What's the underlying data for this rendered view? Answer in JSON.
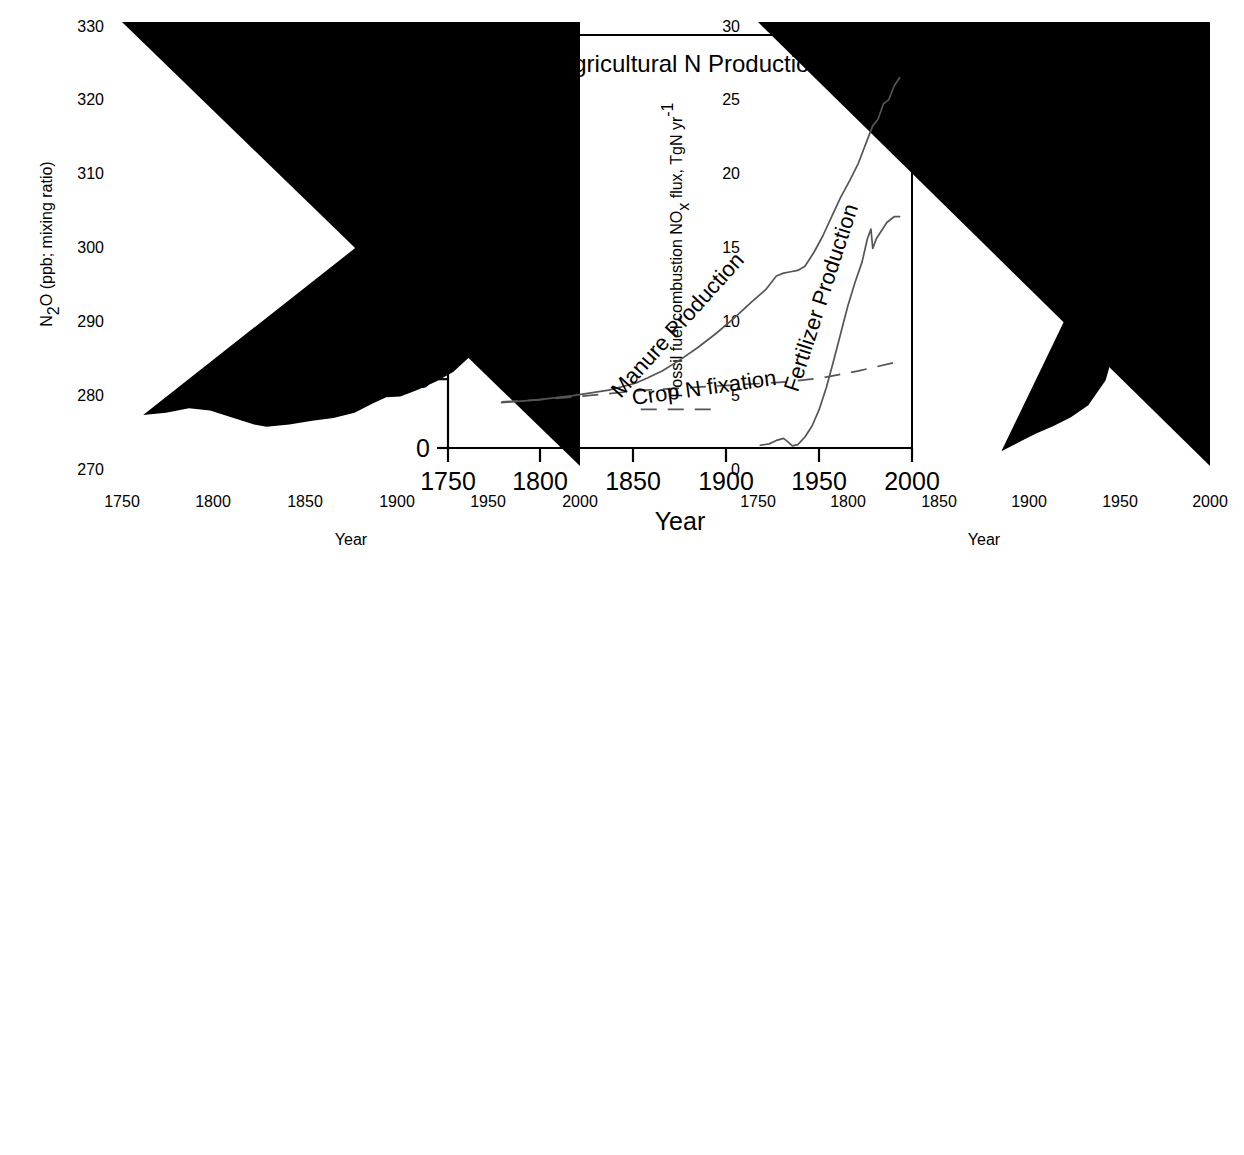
{
  "figure": {
    "panel_count": 3,
    "line_color": "#555555",
    "axis_color": "#000000",
    "background": "#ffffff"
  },
  "chart_data": [
    {
      "id": "n2o",
      "type": "line",
      "title": "N2O (ice core record)",
      "title_parts": {
        "pre": "N",
        "sub": "2",
        "post": "O (ice core record)"
      },
      "xlabel": "Year",
      "ylabel": "N2O (ppb; mixing ratio)",
      "ylabel_parts": {
        "pre": "N",
        "sub": "2",
        "post": "O (ppb; mixing ratio)"
      },
      "xlim": [
        1750,
        2010
      ],
      "ylim": [
        270,
        330
      ],
      "xticks": [
        1750,
        1800,
        1850,
        1900,
        1950,
        2000
      ],
      "yticks": [
        270,
        280,
        290,
        300,
        310,
        320,
        330
      ],
      "grid": false,
      "legend": "none",
      "series": [
        {
          "name": "N2O ice core record",
          "style": "solid",
          "x": [
            1762,
            1775,
            1788,
            1800,
            1812,
            1825,
            1832,
            1845,
            1858,
            1870,
            1882,
            1892,
            1900,
            1908,
            1918,
            1928,
            1938,
            1948,
            1958,
            1968,
            1978,
            1988,
            1998,
            2008
          ],
          "y": [
            276.9,
            277.2,
            277.8,
            277.5,
            276.6,
            275.6,
            275.3,
            275.6,
            276.1,
            276.5,
            277.2,
            278.4,
            279.3,
            279.4,
            280.3,
            281.4,
            282.7,
            284.9,
            287.1,
            290.2,
            294.3,
            300.6,
            310.8,
            323.0
          ]
        }
      ]
    },
    {
      "id": "nox",
      "type": "line",
      "title": "NOx (fossil fuel combustion)",
      "title_parts": {
        "pre": "NO",
        "sub": "x",
        "post": " (fossil fuel combustion)"
      },
      "xlabel": "Year",
      "ylabel": "Fossil fuel combustion NOx  flux, TgN yr-1",
      "ylabel_parts": {
        "pre": "Fossil fuel combustion NO",
        "sub": "x",
        "mid": "  flux, TgN yr",
        "sup": "-1"
      },
      "xlim": [
        1750,
        2010
      ],
      "ylim": [
        0,
        30
      ],
      "xticks": [
        1750,
        1800,
        1850,
        1900,
        1950,
        2000
      ],
      "yticks": [
        0,
        5,
        10,
        15,
        20,
        25,
        30
      ],
      "grid": false,
      "legend": "none",
      "series": [
        {
          "name": "Fossil fuel combustion NOx flux",
          "style": "solid",
          "x": [
            1890,
            1900,
            1910,
            1920,
            1930,
            1940,
            1950,
            1960,
            1970,
            1980,
            1990,
            1998
          ],
          "y": [
            1.0,
            1.6,
            2.2,
            2.7,
            3.3,
            4.1,
            5.8,
            10.0,
            15.0,
            19.6,
            24.9,
            27.3
          ]
        }
      ]
    },
    {
      "id": "agricultural_n",
      "type": "line",
      "title": "Agricultural N Production",
      "xlabel": "Year",
      "ylabel": "TgN yr-1",
      "ylabel_parts": {
        "pre": "TgN yr",
        "sup": "-1"
      },
      "xlim": [
        1750,
        2010
      ],
      "ylim": [
        0,
        30
      ],
      "xticks": [
        1750,
        1800,
        1850,
        1900,
        1950,
        2000
      ],
      "yticks": [
        0,
        5,
        10,
        15,
        20,
        25,
        30
      ],
      "grid": false,
      "legend": "inline-labels",
      "series": [
        {
          "name": "Manure Production",
          "label": "Manure  Production",
          "style": "solid",
          "x": [
            1780,
            1800,
            1820,
            1840,
            1855,
            1862,
            1870,
            1880,
            1890,
            1900,
            1910,
            1920,
            1928,
            1934,
            1938,
            1942,
            1946,
            1950,
            1955,
            1960,
            1965,
            1970,
            1975,
            1980,
            1985,
            1988,
            1991,
            1994,
            1997,
            2000,
            2003
          ],
          "y": [
            3.3,
            3.5,
            3.8,
            4.2,
            4.7,
            5.1,
            5.6,
            6.4,
            7.3,
            8.3,
            9.4,
            10.6,
            11.5,
            12.5,
            12.7,
            12.8,
            12.9,
            13.2,
            14.2,
            15.4,
            16.8,
            18.2,
            19.4,
            20.7,
            22.4,
            23.4,
            23.9,
            25.0,
            25.3,
            26.3,
            26.9
          ]
        },
        {
          "name": "Fertilizer Production",
          "label": "Fertilizer  Production",
          "style": "solid",
          "x": [
            1925,
            1930,
            1934,
            1938,
            1940,
            1943,
            1946,
            1950,
            1954,
            1958,
            1962,
            1966,
            1970,
            1974,
            1978,
            1982,
            1985,
            1987,
            1988,
            1990,
            1993,
            1996,
            2000,
            2003
          ],
          "y": [
            0.2,
            0.3,
            0.55,
            0.7,
            0.5,
            0.15,
            0.25,
            0.8,
            1.6,
            2.8,
            4.4,
            6.3,
            8.3,
            10.3,
            12.0,
            13.5,
            15.2,
            15.9,
            14.5,
            15.2,
            15.8,
            16.4,
            16.8,
            16.8
          ]
        },
        {
          "name": "Crop N fixation",
          "label": "Crop N  fixation",
          "style": "dashed",
          "x": [
            1780,
            1800,
            1820,
            1840,
            1860,
            1880,
            1900,
            1920,
            1940,
            1960,
            1980,
            2000,
            2003
          ],
          "y": [
            3.35,
            3.5,
            3.7,
            3.95,
            4.2,
            4.35,
            4.5,
            4.65,
            4.8,
            5.1,
            5.6,
            6.2,
            6.3
          ]
        },
        {
          "name": "Crop N fixation lower segment",
          "label": "",
          "style": "dashed",
          "x": [
            1858,
            1872,
            1886,
            1900
          ],
          "y": [
            2.8,
            2.8,
            2.8,
            2.8
          ]
        }
      ]
    }
  ]
}
